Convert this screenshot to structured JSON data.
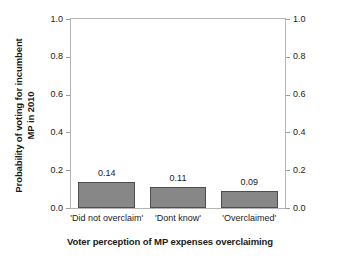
{
  "chart_data": {
    "type": "bar",
    "title": "",
    "xlabel": "Voter perception of MP expenses overclaiming",
    "ylabel_line1": "Probability of voting for incumbent",
    "ylabel_line2": "MP in 2010",
    "categories": [
      "'Did not overclaim'",
      "'Dont know'",
      "'Overclaimed'"
    ],
    "values": [
      0.14,
      0.11,
      0.09
    ],
    "value_labels": [
      "0.14",
      "0.11",
      "0.09"
    ],
    "ylim": [
      0.0,
      1.0
    ],
    "y_ticks": [
      0.0,
      0.2,
      0.4,
      0.6,
      0.8,
      1.0
    ],
    "y_tick_labels": [
      "0.0",
      "0.2",
      "0.4",
      "0.6",
      "0.8",
      "1.0"
    ],
    "right_axis": {
      "ylim": [
        0.0,
        1.0
      ],
      "y_ticks": [
        0.0,
        0.2,
        0.4,
        0.6,
        0.8,
        1.0
      ],
      "y_tick_labels": [
        "0.0",
        "0.2",
        "0.4",
        "0.6",
        "0.8",
        "1.0"
      ]
    },
    "grid": false,
    "legend": null,
    "colors": {
      "bar_fill": "#878787",
      "bar_edge": "#4d4d4d",
      "axis": "#b4b4b4",
      "text": "#1a1a1a",
      "background": "#ffffff"
    }
  }
}
